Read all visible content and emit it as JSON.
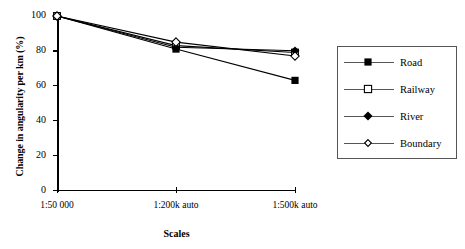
{
  "chart_data": {
    "type": "line",
    "title": "",
    "xlabel": "Scales",
    "ylabel": "Change in angularity per km (%)",
    "categories": [
      "1:50 000",
      "1:200k auto",
      "1:500k auto"
    ],
    "ylim": [
      0,
      100
    ],
    "yticks": [
      0,
      20,
      40,
      60,
      80,
      100
    ],
    "grid": false,
    "legend_position": "right",
    "series": [
      {
        "name": "Road",
        "values": [
          100,
          81,
          63
        ],
        "marker": "filled-square",
        "color": "#000000"
      },
      {
        "name": "Railway",
        "values": [
          100,
          83,
          79
        ],
        "marker": "open-square",
        "color": "#000000"
      },
      {
        "name": "River",
        "values": [
          100,
          82,
          80
        ],
        "marker": "filled-diamond",
        "color": "#000000"
      },
      {
        "name": "Boundary",
        "values": [
          100,
          85,
          77
        ],
        "marker": "open-diamond",
        "color": "#000000"
      }
    ]
  },
  "axes": {
    "y_tick_labels": [
      "100",
      "80",
      "60",
      "40",
      "20",
      "0"
    ],
    "x_tick_labels": [
      "1:50 000",
      "1:200k auto",
      "1:500k auto"
    ],
    "y_title": "Change in angularity per km (%)",
    "x_title": "Scales"
  },
  "legend": {
    "items": [
      {
        "label": "Road"
      },
      {
        "label": "Railway"
      },
      {
        "label": "River"
      },
      {
        "label": "Boundary"
      }
    ]
  }
}
